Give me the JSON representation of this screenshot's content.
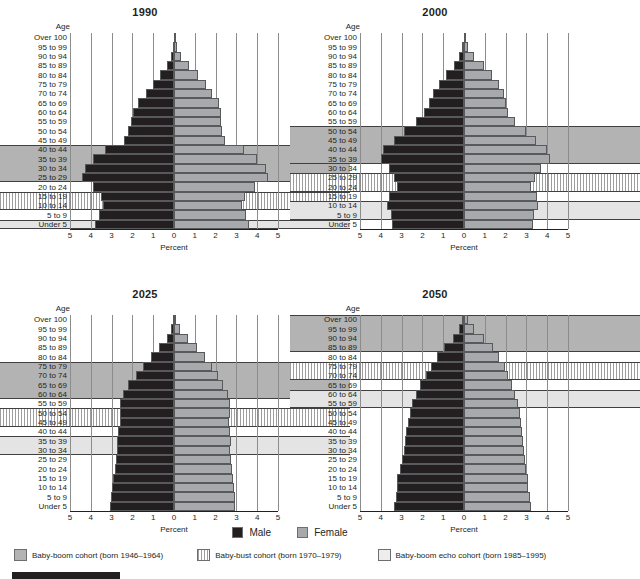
{
  "figure": {
    "x_axis_label": "Percent",
    "age_header": "Age",
    "x_ticks": [
      "5",
      "4",
      "3",
      "2",
      "1",
      "0",
      "1",
      "2",
      "3",
      "4",
      "5"
    ],
    "axis_max": 5
  },
  "legend_sex": {
    "male_label": "Male",
    "female_label": "Female",
    "male_color": "#231f20",
    "female_color": "#a7a9ac"
  },
  "legend_cohorts": [
    {
      "key": "boom",
      "label": "Baby-boom cohort (born 1946–1964)",
      "color": "#b3b3b3"
    },
    {
      "key": "bust",
      "label": "Baby-bust cohort (born 1970–1979)",
      "color": "#9d9d9d"
    },
    {
      "key": "echo",
      "label": "Baby-boom echo cohort (born 1985–1995)",
      "color": "#ededed"
    }
  ],
  "age_groups": [
    "Over 100",
    "95 to 99",
    "90 to 94",
    "85 to 89",
    "80 to 84",
    "75 to 79",
    "70 to 74",
    "65 to 69",
    "60 to 64",
    "55 to 59",
    "50 to 54",
    "45 to 49",
    "40 to 44",
    "35 to 39",
    "30 to 34",
    "25 to 29",
    "20 to 24",
    "15 to 19",
    "10 to 14",
    "5 to 9",
    "Under 5"
  ],
  "chart_data": [
    {
      "type": "bar",
      "title": "1990",
      "xlabel": "Percent",
      "ylabel": "Age",
      "xlim": [
        -5,
        5
      ],
      "grid": true,
      "categories": [
        "Over 100",
        "95 to 99",
        "90 to 94",
        "85 to 89",
        "80 to 84",
        "75 to 79",
        "70 to 74",
        "65 to 69",
        "60 to 64",
        "55 to 59",
        "50 to 54",
        "45 to 49",
        "40 to 44",
        "35 to 39",
        "30 to 34",
        "25 to 29",
        "20 to 24",
        "15 to 19",
        "10 to 14",
        "5 to 9",
        "Under 5"
      ],
      "series": [
        {
          "name": "Male",
          "values": [
            0.01,
            0.05,
            0.15,
            0.35,
            0.65,
            1.0,
            1.35,
            1.75,
            1.95,
            2.05,
            2.2,
            2.4,
            3.3,
            3.9,
            4.3,
            4.4,
            3.9,
            3.5,
            3.4,
            3.6,
            3.8
          ]
        },
        {
          "name": "Female",
          "values": [
            0.03,
            0.14,
            0.36,
            0.72,
            1.15,
            1.55,
            1.85,
            2.15,
            2.25,
            2.25,
            2.3,
            2.45,
            3.35,
            4.0,
            4.4,
            4.5,
            3.9,
            3.4,
            3.25,
            3.45,
            3.6
          ]
        }
      ],
      "cohort_bands": [
        {
          "cohort": "boom",
          "from": "40 to 44",
          "to": "25 to 29"
        },
        {
          "cohort": "bust",
          "from": "15 to 19",
          "to": "10 to 14"
        },
        {
          "cohort": "echo",
          "from": "Under 5",
          "to": "Under 5"
        }
      ]
    },
    {
      "type": "bar",
      "title": "2000",
      "xlabel": "Percent",
      "ylabel": "Age",
      "xlim": [
        -5,
        5
      ],
      "grid": true,
      "categories": [
        "Over 100",
        "95 to 99",
        "90 to 94",
        "85 to 89",
        "80 to 84",
        "75 to 79",
        "70 to 74",
        "65 to 69",
        "60 to 64",
        "55 to 59",
        "50 to 54",
        "45 to 49",
        "40 to 44",
        "35 to 39",
        "30 to 34",
        "25 to 29",
        "20 to 24",
        "15 to 19",
        "10 to 14",
        "5 to 9",
        "Under 5"
      ],
      "series": [
        {
          "name": "Male",
          "values": [
            0.02,
            0.08,
            0.22,
            0.5,
            0.85,
            1.2,
            1.5,
            1.7,
            1.9,
            2.3,
            2.9,
            3.35,
            3.9,
            4.0,
            3.6,
            3.35,
            3.2,
            3.6,
            3.7,
            3.5,
            3.45
          ]
        },
        {
          "name": "Female",
          "values": [
            0.05,
            0.2,
            0.5,
            0.95,
            1.35,
            1.7,
            1.9,
            2.0,
            2.1,
            2.45,
            3.0,
            3.45,
            4.0,
            4.15,
            3.7,
            3.4,
            3.2,
            3.5,
            3.55,
            3.35,
            3.3
          ]
        }
      ],
      "cohort_bands": [
        {
          "cohort": "boom",
          "from": "50 to 54",
          "to": "35 to 39"
        },
        {
          "cohort": "bust",
          "from": "25 to 29",
          "to": "20 to 24"
        },
        {
          "cohort": "echo",
          "from": "10 to 14",
          "to": "5 to 9"
        }
      ]
    },
    {
      "type": "bar",
      "title": "2025",
      "xlabel": "Percent",
      "ylabel": "Age",
      "xlim": [
        -5,
        5
      ],
      "grid": true,
      "categories": [
        "Over 100",
        "95 to 99",
        "90 to 94",
        "85 to 89",
        "80 to 84",
        "75 to 79",
        "70 to 74",
        "65 to 69",
        "60 to 64",
        "55 to 59",
        "50 to 54",
        "45 to 49",
        "40 to 44",
        "35 to 39",
        "30 to 34",
        "25 to 29",
        "20 to 24",
        "15 to 19",
        "10 to 14",
        "5 to 9",
        "Under 5"
      ],
      "series": [
        {
          "name": "Male",
          "values": [
            0.04,
            0.14,
            0.35,
            0.7,
            1.1,
            1.5,
            1.85,
            2.2,
            2.45,
            2.6,
            2.6,
            2.6,
            2.7,
            2.75,
            2.75,
            2.8,
            2.85,
            2.95,
            3.0,
            3.05,
            3.1
          ]
        },
        {
          "name": "Female",
          "values": [
            0.1,
            0.3,
            0.65,
            1.1,
            1.5,
            1.85,
            2.1,
            2.35,
            2.6,
            2.7,
            2.7,
            2.65,
            2.7,
            2.75,
            2.7,
            2.75,
            2.8,
            2.85,
            2.9,
            2.95,
            2.95
          ]
        }
      ],
      "cohort_bands": [
        {
          "cohort": "boom",
          "from": "75 to 79",
          "to": "60 to 64"
        },
        {
          "cohort": "bust",
          "from": "50 to 54",
          "to": "45 to 49"
        },
        {
          "cohort": "echo",
          "from": "35 to 39",
          "to": "30 to 34"
        }
      ]
    },
    {
      "type": "bar",
      "title": "2050",
      "xlabel": "Percent",
      "ylabel": "Age",
      "xlim": [
        -5,
        5
      ],
      "grid": true,
      "categories": [
        "Over 100",
        "95 to 99",
        "90 to 94",
        "85 to 89",
        "80 to 84",
        "75 to 79",
        "70 to 74",
        "65 to 69",
        "60 to 64",
        "55 to 59",
        "50 to 54",
        "45 to 49",
        "40 to 44",
        "35 to 39",
        "30 to 34",
        "25 to 29",
        "20 to 24",
        "15 to 19",
        "10 to 14",
        "5 to 9",
        "Under 5"
      ],
      "series": [
        {
          "name": "Male",
          "values": [
            0.08,
            0.25,
            0.55,
            0.95,
            1.3,
            1.6,
            1.85,
            2.1,
            2.3,
            2.5,
            2.6,
            2.7,
            2.8,
            2.85,
            2.9,
            3.0,
            3.1,
            3.2,
            3.2,
            3.25,
            3.35
          ]
        },
        {
          "name": "Female",
          "values": [
            0.2,
            0.5,
            0.95,
            1.4,
            1.7,
            1.95,
            2.1,
            2.3,
            2.45,
            2.6,
            2.7,
            2.75,
            2.8,
            2.85,
            2.9,
            2.95,
            3.0,
            3.1,
            3.1,
            3.15,
            3.2
          ]
        }
      ],
      "cohort_bands": [
        {
          "cohort": "boom",
          "from": "Over 100",
          "to": "85 to 89"
        },
        {
          "cohort": "bust",
          "from": "75 to 79",
          "to": "70 to 74"
        },
        {
          "cohort": "echo",
          "from": "60 to 64",
          "to": "55 to 59"
        }
      ]
    }
  ]
}
